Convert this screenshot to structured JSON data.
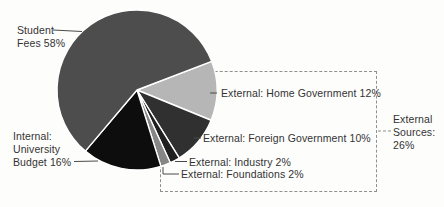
{
  "chart_data": {
    "type": "pie",
    "categories": [
      "Student Fees",
      "External: Home Government",
      "External: Foreign Government",
      "External: Industry",
      "External: Foundations",
      "Internal: University Budget"
    ],
    "values": [
      58,
      12,
      10,
      2,
      2,
      16
    ],
    "group_annotation": {
      "label": "External Sources",
      "value": 26
    },
    "start_angle_deg": 21,
    "direction": "clockwise",
    "center": [
      137,
      90
    ],
    "radius": 80,
    "slice_border_color": "#ffffff",
    "slices": [
      {
        "id": "home-government",
        "label": "External: Home Government",
        "value": 12,
        "color": "#b6b6b6"
      },
      {
        "id": "foreign-government",
        "label": "External: Foreign Government",
        "value": 10,
        "color": "#303030"
      },
      {
        "id": "industry",
        "label": "External: Industry",
        "value": 2,
        "color": "#1f1f1f"
      },
      {
        "id": "foundations",
        "label": "External: Foundations",
        "value": 2,
        "color": "#868686"
      },
      {
        "id": "university-budget",
        "label": "Internal: University Budget",
        "value": 16,
        "color": "#0d0d0d"
      },
      {
        "id": "student-fees",
        "label": "Student Fees",
        "value": 58,
        "color": "#4d4d4d"
      }
    ]
  },
  "callouts": {
    "student": "Student\nFees 58%",
    "internal": "Internal:\nUniversity\nBudget 16%",
    "home_government": "External: Home Government 12%",
    "foreign_government": "External: Foreign Government 10%",
    "industry": "External: Industry 2%",
    "foundations": "External: Foundations 2%",
    "external_sources": "External\nSources:\n26%"
  },
  "colors": {
    "leader_line": "#4a4a4a",
    "dashed_box": "#8f8f8f",
    "text": "#333333"
  }
}
